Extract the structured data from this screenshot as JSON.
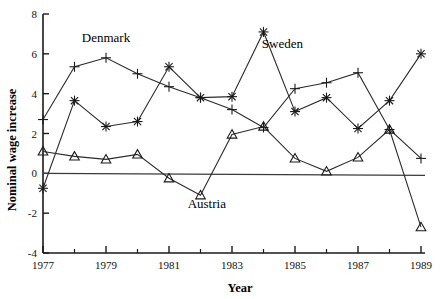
{
  "chart_data": {
    "type": "line",
    "title": "",
    "xlabel": "Year",
    "ylabel": "Nominal wage increase",
    "xlim": [
      1977,
      1989
    ],
    "ylim": [
      -4,
      8
    ],
    "xticks": [
      1977,
      1979,
      1981,
      1983,
      1985,
      1987,
      1989
    ],
    "xtick_labels": [
      "1977",
      "1979",
      "1981",
      "1983",
      "1985",
      "1987",
      "1989"
    ],
    "xminor_ticks": [
      1978,
      1980,
      1982,
      1984,
      1986,
      1988
    ],
    "yticks": [
      -4,
      -2,
      0,
      2,
      4,
      6,
      8
    ],
    "ytick_labels": [
      "-4",
      "-2",
      "0",
      "2",
      "4",
      "6",
      "8"
    ],
    "grid": false,
    "legend": "inline-annotations",
    "zero_line": 0,
    "x": [
      1977,
      1978,
      1979,
      1980,
      1981,
      1982,
      1983,
      1984,
      1985,
      1986,
      1987,
      1988,
      1989
    ],
    "series": [
      {
        "name": "Denmark",
        "marker": "plus",
        "label_x": 1979.0,
        "label_y": 6.6,
        "values": [
          2.7,
          5.35,
          5.8,
          5.0,
          4.35,
          3.8,
          3.2,
          2.3,
          4.25,
          4.55,
          5.05,
          2.2,
          0.75
        ]
      },
      {
        "name": "Sweden",
        "marker": "asterisk",
        "label_x": 1984.6,
        "label_y": 6.3,
        "values": [
          -0.75,
          3.65,
          2.35,
          2.6,
          5.35,
          3.8,
          3.85,
          7.1,
          3.1,
          3.8,
          2.25,
          3.65,
          6.0
        ]
      },
      {
        "name": "Austria",
        "marker": "triangle",
        "label_x": 1982.2,
        "label_y": -1.75,
        "values": [
          1.1,
          0.85,
          0.7,
          0.95,
          -0.25,
          -1.1,
          1.95,
          2.35,
          0.75,
          0.1,
          0.8,
          2.2,
          -2.7
        ]
      }
    ]
  }
}
